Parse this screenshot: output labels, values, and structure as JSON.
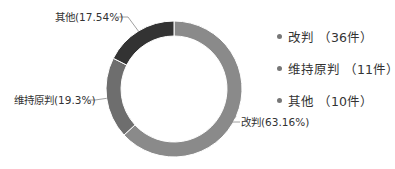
{
  "chart_data": {
    "type": "pie",
    "variant": "donut",
    "title": "",
    "categories": [
      "改判",
      "维持原判",
      "其他"
    ],
    "values": [
      36,
      11,
      10
    ],
    "percentages": [
      63.16,
      19.3,
      17.54
    ],
    "unit": "件",
    "colors": [
      "#8a8a8a",
      "#6e6e6e",
      "#333333"
    ],
    "slice_labels": [
      "改判(63.16%)",
      "维持原判(19.3%)",
      "其他(17.54%)"
    ],
    "legend": {
      "position": "right",
      "entries": [
        "改判 （36件）",
        "维持原判 （11件）",
        "其他 （10件）"
      ]
    }
  }
}
